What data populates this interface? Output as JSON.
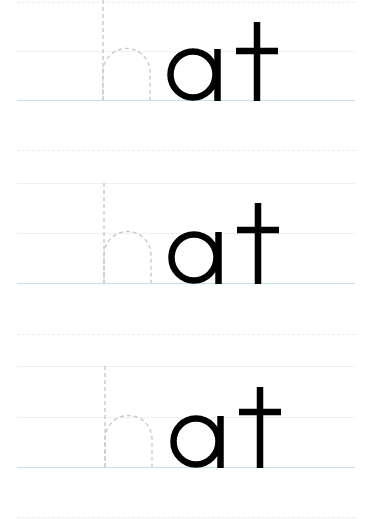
{
  "worksheet": {
    "type": "handwriting tracing practice",
    "word": "hat",
    "rows": [
      {
        "trace_letters": "h",
        "solid_letters": "at",
        "full_word": "hat"
      },
      {
        "trace_letters": "h",
        "solid_letters": "at",
        "full_word": "hat"
      },
      {
        "trace_letters": "h",
        "solid_letters": "at",
        "full_word": "hat"
      }
    ],
    "colors": {
      "background": "#ffffff",
      "solid_letter": "#000000",
      "trace_letter": "#c9c9c9",
      "baseline": "#bfe6ec",
      "guide_line": "#ececec"
    }
  }
}
